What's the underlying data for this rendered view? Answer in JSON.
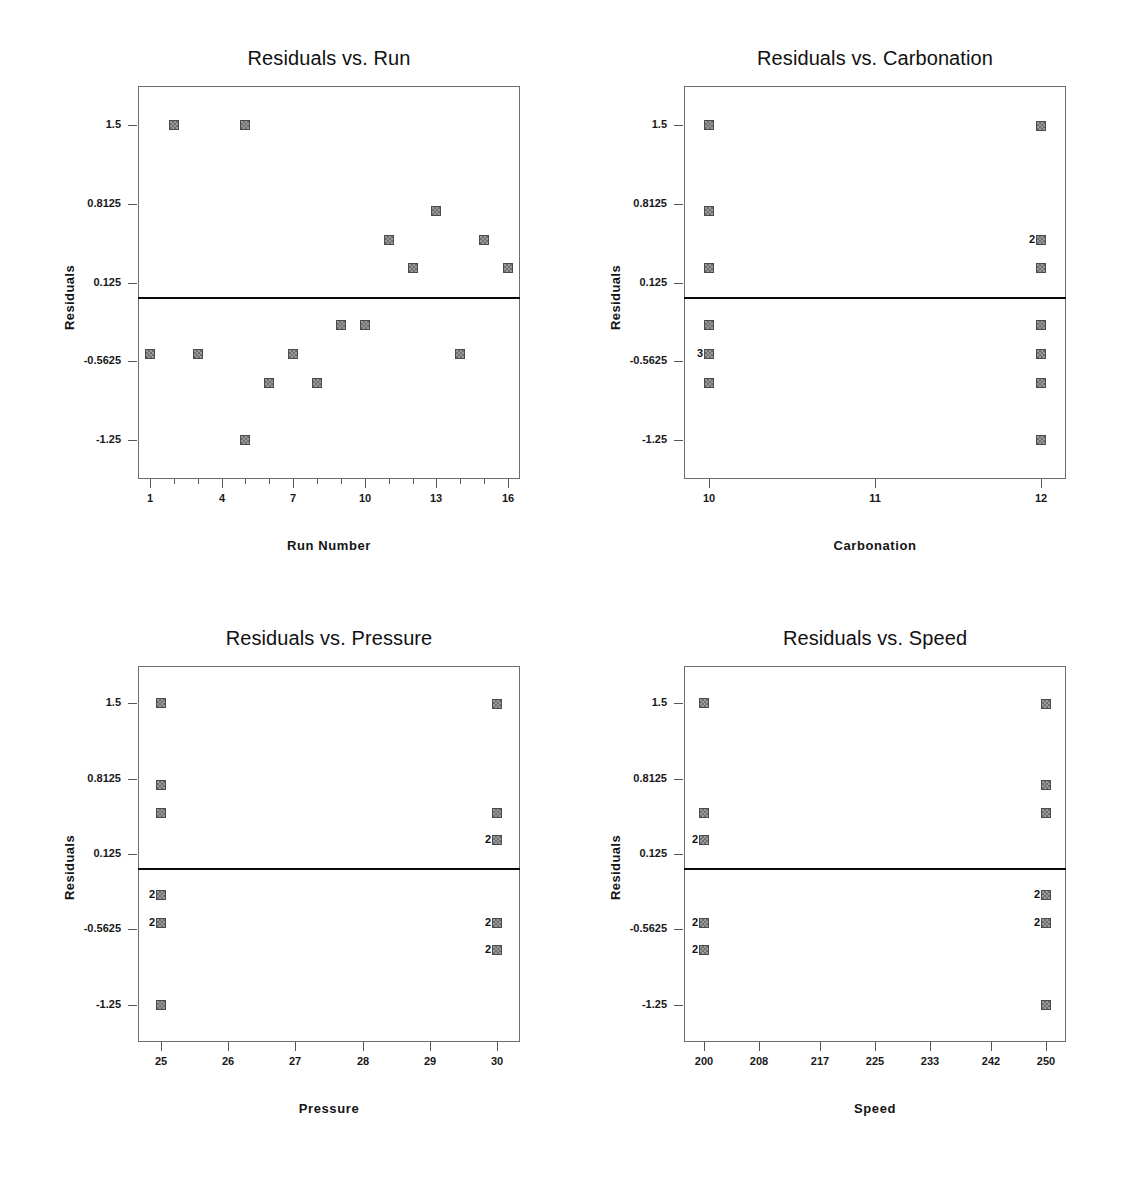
{
  "page": {
    "background_color": "#ffffff",
    "marker_color": "#9a9a9a",
    "marker_border_color": "#4a4a4a",
    "reference_line_color": "#0a0a0a",
    "frame_color": "#6d6d6d"
  },
  "chart_data": [
    {
      "type": "scatter",
      "title": "Residuals vs. Run",
      "xlabel": "Run Number",
      "ylabel": "Residuals",
      "xlim": [
        0.5,
        16.5
      ],
      "ylim": [
        -1.59,
        1.84
      ],
      "xticks": [
        1,
        4,
        7,
        10,
        13,
        16
      ],
      "xtick_labels": [
        "1",
        "4",
        "7",
        "10",
        "13",
        "16"
      ],
      "xminor_ticks": [
        2,
        3,
        5,
        6,
        8,
        9,
        11,
        12,
        14,
        15
      ],
      "yticks": [
        1.5,
        0.8125,
        0.125,
        -0.5625,
        -1.25
      ],
      "ytick_labels": [
        "1.5",
        "0.8125",
        "0.125",
        "-0.5625",
        "-1.25"
      ],
      "reference_line_y": 0,
      "grid": false,
      "legend": "none",
      "points": [
        {
          "x": 1,
          "y": -0.5,
          "count": 1
        },
        {
          "x": 2,
          "y": 1.5,
          "count": 1
        },
        {
          "x": 3,
          "y": -0.5,
          "count": 1
        },
        {
          "x": 5,
          "y": 1.5,
          "count": 1
        },
        {
          "x": 5,
          "y": -1.25,
          "count": 1
        },
        {
          "x": 6,
          "y": -0.75,
          "count": 1
        },
        {
          "x": 7,
          "y": -0.5,
          "count": 1
        },
        {
          "x": 8,
          "y": -0.75,
          "count": 1
        },
        {
          "x": 9,
          "y": -0.25,
          "count": 1
        },
        {
          "x": 10,
          "y": -0.25,
          "count": 1
        },
        {
          "x": 11,
          "y": 0.5,
          "count": 1
        },
        {
          "x": 12,
          "y": 0.25,
          "count": 1
        },
        {
          "x": 13,
          "y": 0.75,
          "count": 1
        },
        {
          "x": 14,
          "y": -0.5,
          "count": 1
        },
        {
          "x": 15,
          "y": 0.5,
          "count": 1
        },
        {
          "x": 16,
          "y": 0.25,
          "count": 1
        }
      ]
    },
    {
      "type": "scatter",
      "title": "Residuals vs. Carbonation",
      "xlabel": "Carbonation",
      "ylabel": "Residuals",
      "xlim": [
        9.85,
        12.15
      ],
      "ylim": [
        -1.59,
        1.84
      ],
      "xticks": [
        10,
        11,
        12
      ],
      "xtick_labels": [
        "10",
        "11",
        "12"
      ],
      "xminor_ticks": [],
      "yticks": [
        1.5,
        0.8125,
        0.125,
        -0.5625,
        -1.25
      ],
      "ytick_labels": [
        "1.5",
        "0.8125",
        "0.125",
        "-0.5625",
        "-1.25"
      ],
      "reference_line_y": 0,
      "grid": false,
      "legend": "none",
      "points": [
        {
          "x": 10,
          "y": 1.5,
          "count": 1
        },
        {
          "x": 10,
          "y": 0.75,
          "count": 1
        },
        {
          "x": 10,
          "y": 0.25,
          "count": 1
        },
        {
          "x": 10,
          "y": -0.25,
          "count": 1
        },
        {
          "x": 10,
          "y": -0.5,
          "count": 3
        },
        {
          "x": 10,
          "y": -0.75,
          "count": 1
        },
        {
          "x": 12,
          "y": 1.49,
          "count": 1
        },
        {
          "x": 12,
          "y": 0.5,
          "count": 2
        },
        {
          "x": 12,
          "y": 0.25,
          "count": 1
        },
        {
          "x": 12,
          "y": -0.25,
          "count": 1
        },
        {
          "x": 12,
          "y": -0.5,
          "count": 1
        },
        {
          "x": 12,
          "y": -0.75,
          "count": 1
        },
        {
          "x": 12,
          "y": -1.25,
          "count": 1
        }
      ]
    },
    {
      "type": "scatter",
      "title": "Residuals vs. Pressure",
      "xlabel": "Pressure",
      "ylabel": "Residuals",
      "xlim": [
        24.65,
        30.35
      ],
      "ylim": [
        -1.59,
        1.84
      ],
      "xticks": [
        25,
        26,
        27,
        28,
        29,
        30
      ],
      "xtick_labels": [
        "25",
        "26",
        "27",
        "28",
        "29",
        "30"
      ],
      "xminor_ticks": [],
      "yticks": [
        1.5,
        0.8125,
        0.125,
        -0.5625,
        -1.25
      ],
      "ytick_labels": [
        "1.5",
        "0.8125",
        "0.125",
        "-0.5625",
        "-1.25"
      ],
      "reference_line_y": 0,
      "grid": false,
      "legend": "none",
      "points": [
        {
          "x": 25,
          "y": 1.5,
          "count": 1
        },
        {
          "x": 25,
          "y": 0.75,
          "count": 1
        },
        {
          "x": 25,
          "y": 0.5,
          "count": 1
        },
        {
          "x": 25,
          "y": -0.25,
          "count": 2
        },
        {
          "x": 25,
          "y": -0.5,
          "count": 2
        },
        {
          "x": 25,
          "y": -1.25,
          "count": 1
        },
        {
          "x": 30,
          "y": 1.49,
          "count": 1
        },
        {
          "x": 30,
          "y": 0.5,
          "count": 1
        },
        {
          "x": 30,
          "y": 0.25,
          "count": 2
        },
        {
          "x": 30,
          "y": -0.5,
          "count": 2
        },
        {
          "x": 30,
          "y": -0.75,
          "count": 2
        }
      ]
    },
    {
      "type": "scatter",
      "title": "Residuals vs. Speed",
      "xlabel": "Speed",
      "ylabel": "Residuals",
      "xlim": [
        197,
        253
      ],
      "ylim": [
        -1.59,
        1.84
      ],
      "xticks": [
        200,
        208,
        217,
        225,
        233,
        242,
        250
      ],
      "xtick_labels": [
        "200",
        "208",
        "217",
        "225",
        "233",
        "242",
        "250"
      ],
      "xminor_ticks": [],
      "yticks": [
        1.5,
        0.8125,
        0.125,
        -0.5625,
        -1.25
      ],
      "ytick_labels": [
        "1.5",
        "0.8125",
        "0.125",
        "-0.5625",
        "-1.25"
      ],
      "reference_line_y": 0,
      "grid": false,
      "legend": "none",
      "points": [
        {
          "x": 200,
          "y": 1.5,
          "count": 1
        },
        {
          "x": 200,
          "y": 0.5,
          "count": 1
        },
        {
          "x": 200,
          "y": 0.25,
          "count": 2
        },
        {
          "x": 200,
          "y": -0.5,
          "count": 2
        },
        {
          "x": 200,
          "y": -0.75,
          "count": 2
        },
        {
          "x": 250,
          "y": 1.49,
          "count": 1
        },
        {
          "x": 250,
          "y": 0.75,
          "count": 1
        },
        {
          "x": 250,
          "y": 0.5,
          "count": 1
        },
        {
          "x": 250,
          "y": -0.25,
          "count": 2
        },
        {
          "x": 250,
          "y": -0.5,
          "count": 2
        },
        {
          "x": 250,
          "y": -1.25,
          "count": 1
        }
      ]
    }
  ]
}
